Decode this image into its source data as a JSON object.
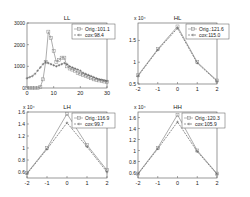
{
  "chart_data": [
    {
      "type": "line",
      "title": "LL",
      "xlim": [
        0,
        30
      ],
      "ylim": [
        0,
        3000
      ],
      "xticks": [
        "0",
        "10",
        "20",
        "30"
      ],
      "yticks": [
        "0",
        "1000",
        "2000",
        "3000"
      ],
      "exponent": "",
      "legend": [
        "Orig.:101.1",
        "cox:98.4"
      ],
      "series": [
        {
          "name": "Orig.:101.1",
          "marker": "square",
          "style": "solid",
          "x": [
            0,
            1,
            2,
            3,
            4,
            5,
            6,
            7,
            8,
            9,
            10,
            11,
            12,
            13,
            14,
            15,
            16,
            17,
            18,
            19,
            20,
            21,
            22,
            23,
            24,
            25,
            26,
            27,
            28,
            29,
            30
          ],
          "y": [
            0,
            0,
            0,
            0,
            0,
            50,
            400,
            1200,
            2600,
            2300,
            1700,
            1200,
            1300,
            1400,
            1400,
            1000,
            900,
            850,
            800,
            700,
            650,
            600,
            550,
            500,
            450,
            400,
            380,
            350,
            320,
            300,
            280
          ]
        },
        {
          "name": "cox:98.4",
          "marker": "plus",
          "style": "dashed",
          "x": [
            0,
            1,
            2,
            3,
            4,
            5,
            6,
            7,
            8,
            9,
            10,
            11,
            12,
            13,
            14,
            15,
            16,
            17,
            18,
            19,
            20,
            21,
            22,
            23,
            24,
            25,
            26,
            27,
            28,
            29,
            30
          ],
          "y": [
            450,
            500,
            550,
            650,
            800,
            950,
            1100,
            1200,
            1150,
            1100,
            1050,
            1000,
            1050,
            1100,
            1150,
            1100,
            1000,
            950,
            900,
            850,
            800,
            700,
            650,
            600,
            550,
            500,
            450,
            400,
            380,
            350,
            320
          ]
        }
      ]
    },
    {
      "type": "line",
      "title": "HL",
      "xlim": [
        -2,
        2
      ],
      "ylim": [
        0.5,
        1.9
      ],
      "xticks": [
        "-2",
        "-1",
        "0",
        "1",
        "2"
      ],
      "yticks": [
        "0.5",
        "1",
        "1.5"
      ],
      "exponent": "x 10⁴",
      "legend": [
        "Orig.:121.6",
        "cox:115.0"
      ],
      "series": [
        {
          "name": "Orig.:121.6",
          "marker": "square",
          "style": "solid",
          "x": [
            -2,
            -1,
            0,
            1,
            2
          ],
          "y": [
            0.7,
            1.3,
            1.82,
            1.0,
            0.58
          ]
        },
        {
          "name": "cox:115.0",
          "marker": "plus",
          "style": "dashed",
          "x": [
            -2,
            -1,
            0,
            1,
            2
          ],
          "y": [
            0.68,
            1.28,
            1.78,
            0.98,
            0.56
          ]
        }
      ]
    },
    {
      "type": "line",
      "title": "LH",
      "xlim": [
        -2,
        2
      ],
      "ylim": [
        0.5,
        1.6
      ],
      "xticks": [
        "-2",
        "-1",
        "0",
        "1",
        "2"
      ],
      "yticks": [
        "0.6",
        "0.8",
        "1",
        "1.2",
        "1.4",
        "1.6"
      ],
      "exponent": "x 10⁴",
      "legend": [
        "Orig.:116.9",
        "cox:99.7"
      ],
      "series": [
        {
          "name": "Orig.:116.9",
          "marker": "square",
          "style": "solid",
          "x": [
            -2,
            -1,
            0,
            1,
            2
          ],
          "y": [
            0.58,
            1.0,
            1.57,
            1.05,
            0.63
          ]
        },
        {
          "name": "cox:99.7",
          "marker": "plus",
          "style": "dashed",
          "x": [
            -2,
            -1,
            0,
            1,
            2
          ],
          "y": [
            0.57,
            0.98,
            1.42,
            1.02,
            0.6
          ]
        }
      ]
    },
    {
      "type": "line",
      "title": "HH",
      "xlim": [
        -2,
        2
      ],
      "ylim": [
        0.5,
        1.7
      ],
      "xticks": [
        "-2",
        "-1",
        "0",
        "1",
        "2"
      ],
      "yticks": [
        "0.6",
        "0.8",
        "1",
        "1.2",
        "1.4",
        "1.6"
      ],
      "exponent": "x 10⁴",
      "legend": [
        "Orig.:120.3",
        "cox:105.9"
      ],
      "series": [
        {
          "name": "Orig.:120.3",
          "marker": "square",
          "style": "solid",
          "x": [
            -2,
            -1,
            0,
            1,
            2
          ],
          "y": [
            0.58,
            1.05,
            1.65,
            1.0,
            0.58
          ]
        },
        {
          "name": "cox:105.9",
          "marker": "plus",
          "style": "dashed",
          "x": [
            -2,
            -1,
            0,
            1,
            2
          ],
          "y": [
            0.57,
            1.03,
            1.52,
            0.98,
            0.57
          ]
        }
      ]
    }
  ],
  "panels_layout": [
    {
      "x0": 27,
      "y0": 23,
      "x1": 107,
      "y1": 88
    },
    {
      "x0": 138,
      "y0": 23,
      "x1": 217,
      "y1": 84
    },
    {
      "x0": 27,
      "y0": 112,
      "x1": 107,
      "y1": 178
    },
    {
      "x0": 138,
      "y0": 112,
      "x1": 217,
      "y1": 178
    }
  ],
  "colors": {
    "orig": "#8a8a8a",
    "cox": "#5a5a5a",
    "axis": "#555555"
  }
}
